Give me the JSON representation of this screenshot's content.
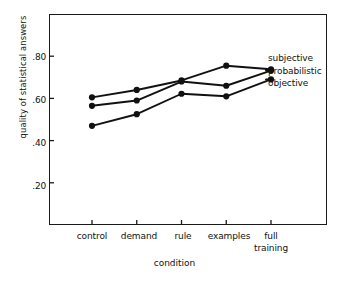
{
  "chart_data": {
    "type": "line",
    "title": "",
    "xlabel": "condition",
    "ylabel": "quality of statistical answers",
    "categories": [
      "control",
      "demand",
      "rule",
      "examples",
      "full training"
    ],
    "ylim": [
      0.0,
      1.0
    ],
    "yticks": [
      0.2,
      0.4,
      0.6,
      0.8
    ],
    "ytick_labels": [
      ".20",
      ".40",
      ".60",
      ".80"
    ],
    "grid": false,
    "legend_position": "right",
    "series": [
      {
        "name": "subjective",
        "values": [
          0.605,
          0.64,
          0.685,
          0.755,
          0.738
        ]
      },
      {
        "name": "probabilistic",
        "values": [
          0.565,
          0.59,
          0.68,
          0.66,
          0.732
        ]
      },
      {
        "name": "objective",
        "values": [
          0.47,
          0.525,
          0.622,
          0.61,
          0.69
        ]
      }
    ]
  },
  "axes": {
    "y": {
      "title": "quality of statistical answers",
      "tick_labels": [
        ".80",
        ".60",
        ".40",
        ".20"
      ]
    },
    "x": {
      "title": "condition",
      "tick_labels": [
        "control",
        "demand",
        "rule",
        "examples",
        "full"
      ],
      "tick_labels_line2": [
        "",
        "",
        "",
        "",
        "training"
      ]
    }
  },
  "legend": {
    "entries": [
      {
        "label": "subjective"
      },
      {
        "label": "probabilistic"
      },
      {
        "label": "objective"
      }
    ]
  },
  "style": {
    "line_color": "#111111",
    "marker_color": "#111111",
    "frame_color": "#1a1a1a",
    "background": "#ffffff"
  }
}
